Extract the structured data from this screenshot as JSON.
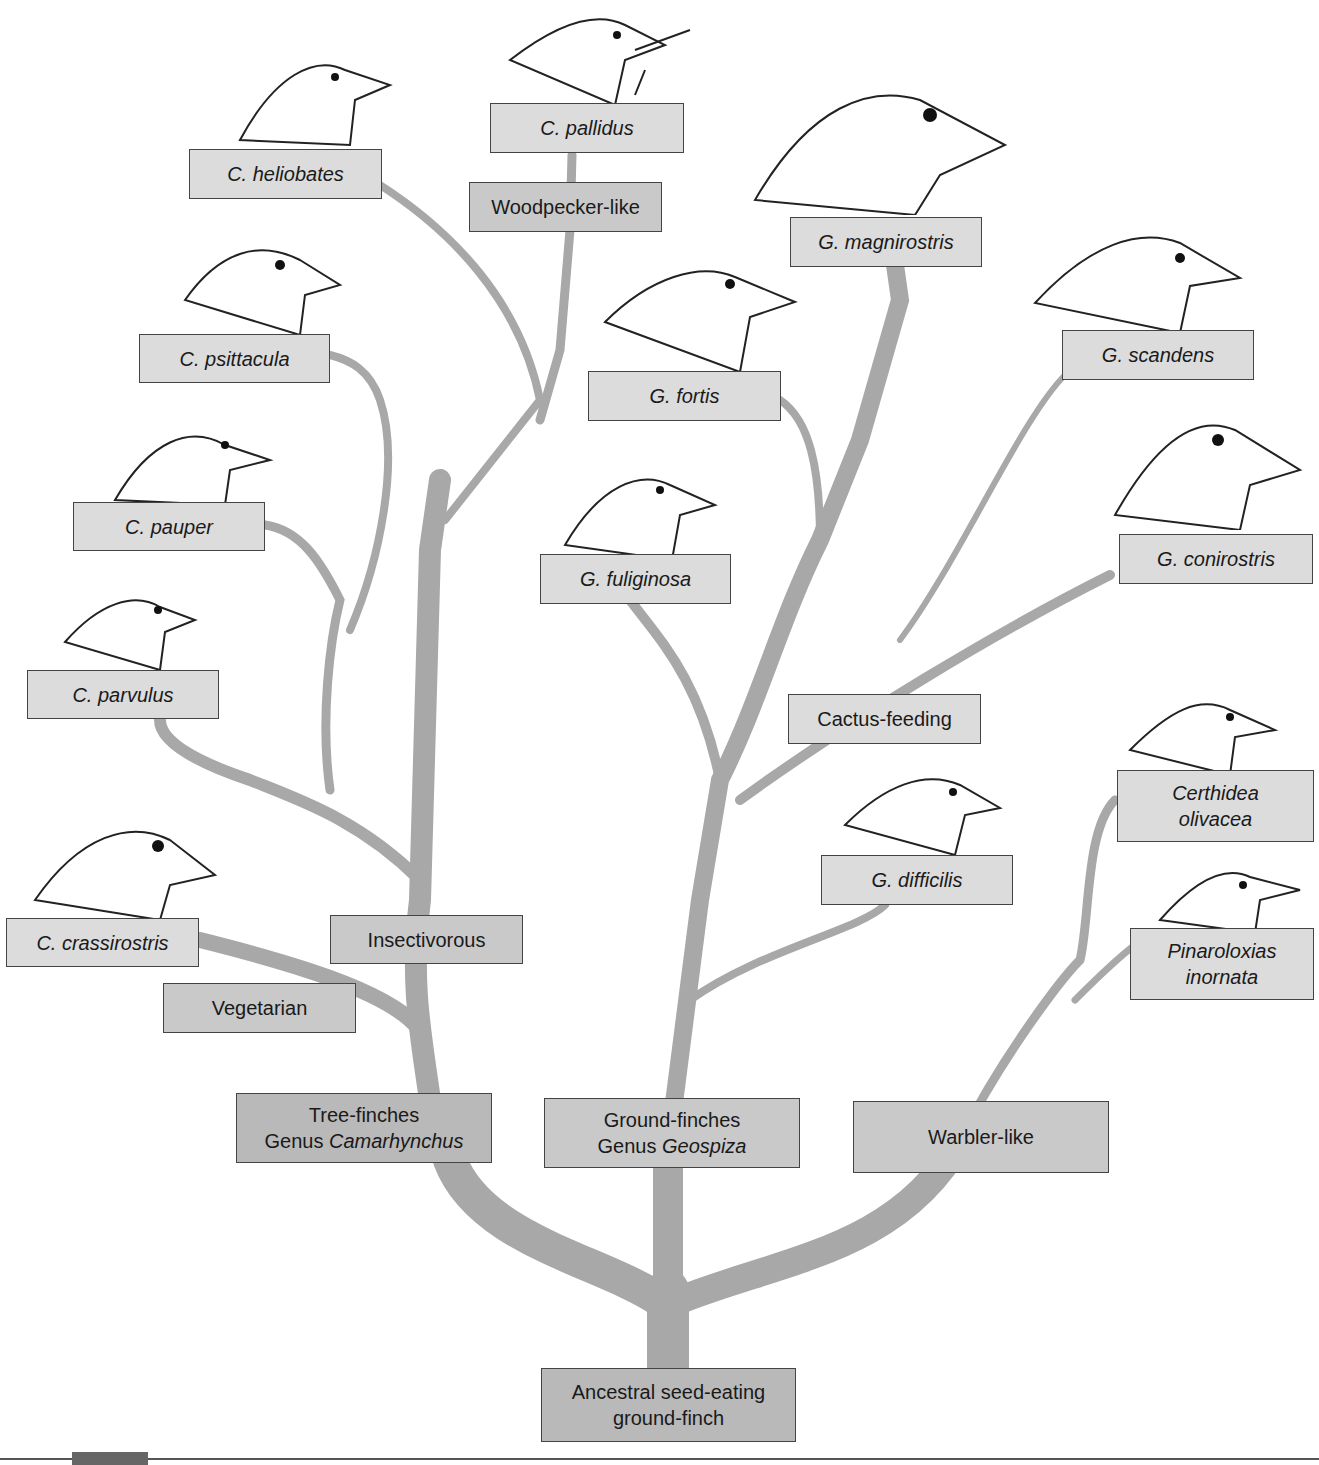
{
  "diagram": {
    "colors": {
      "branch": "#a8a8a8",
      "box_light": "#dcdcdc",
      "box_mid": "#c9c9c9",
      "box_dark": "#b9b9b9",
      "border": "#444444"
    },
    "root": {
      "line1": "Ancestral seed-eating",
      "line2": "ground-finch"
    },
    "groups": {
      "tree_finches": {
        "line1": "Tree-finches",
        "line2_prefix": "Genus ",
        "line2_genus": "Camarhynchus"
      },
      "ground_finches": {
        "line1": "Ground-finches",
        "line2_prefix": "Genus ",
        "line2_genus": "Geospiza"
      },
      "warbler_like": {
        "label": "Warbler-like"
      }
    },
    "diets": {
      "vegetarian": "Vegetarian",
      "insectivorous": "Insectivorous",
      "woodpecker_like": "Woodpecker-like",
      "cactus_feeding": "Cactus-feeding"
    },
    "species": {
      "c_heliobates": "C. heliobates",
      "c_pallidus": "C. pallidus",
      "c_psittacula": "C. psittacula",
      "c_pauper": "C. pauper",
      "c_parvulus": "C. parvulus",
      "c_crassirostris": "C. crassirostris",
      "g_magnirostris": "G. magnirostris",
      "g_fortis": "G. fortis",
      "g_fuliginosa": "G. fuliginosa",
      "g_scandens": "G. scandens",
      "g_conirostris": "G. conirostris",
      "g_difficilis": "G. difficilis",
      "certhidea_line1": "Certhidea",
      "certhidea_line2": "olivacea",
      "pinaroloxias_line1": "Pinaroloxias",
      "pinaroloxias_line2": "inornata"
    },
    "icons": [
      "finch-head-icon"
    ]
  }
}
